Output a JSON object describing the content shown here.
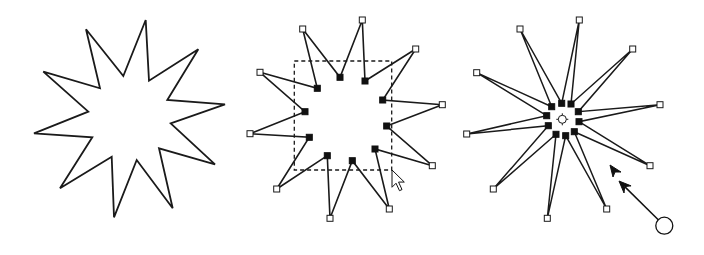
{
  "diagram": {
    "colors": {
      "stroke": "#1a1a1a",
      "handle_fill_outer": "#ffffff",
      "handle_fill_inner": "#111111",
      "background": "#ffffff"
    },
    "star_plain": {
      "outer": [
        [
          145.7,
          20
        ],
        [
          198.3,
          49.3
        ],
        [
          225,
          104.3
        ],
        [
          215,
          164.3
        ],
        [
          172.7,
          208.3
        ],
        [
          114,
          217.3
        ],
        [
          60,
          188.3
        ],
        [
          34,
          133.3
        ],
        [
          43.3,
          71.7
        ],
        [
          86,
          29.3
        ]
      ],
      "inner": [
        [
          149,
          80.7
        ],
        [
          167.3,
          100
        ],
        [
          170.7,
          123.3
        ],
        [
          159,
          148.3
        ],
        [
          136.7,
          160
        ],
        [
          111.7,
          156.7
        ],
        [
          92.3,
          137.3
        ],
        [
          88.3,
          111.7
        ],
        [
          100,
          88.3
        ],
        [
          123.3,
          76
        ]
      ]
    },
    "star_selected": {
      "outer": [
        [
          362.3,
          20
        ],
        [
          415.7,
          49
        ],
        [
          442.3,
          104.7
        ],
        [
          432.3,
          165.7
        ],
        [
          389.3,
          209
        ],
        [
          330,
          218.3
        ],
        [
          276.7,
          189
        ],
        [
          250,
          133.7
        ],
        [
          260,
          72.3
        ],
        [
          302.7,
          29
        ]
      ],
      "inner": [
        [
          365,
          81
        ],
        [
          382.7,
          100
        ],
        [
          386.7,
          126
        ],
        [
          375,
          149
        ],
        [
          352.3,
          160.7
        ],
        [
          327.3,
          155.7
        ],
        [
          309.3,
          137.3
        ],
        [
          305,
          111.7
        ],
        [
          317.3,
          88.3
        ],
        [
          340,
          77.3
        ]
      ],
      "bounding_box": {
        "x": 294.3,
        "y": 61,
        "width": 97.4,
        "height": 109
      },
      "cursor": {
        "tip": [
          392,
          170
        ]
      }
    },
    "star_scaled": {
      "outer": [
        [
          579.3,
          20
        ],
        [
          632.7,
          49
        ],
        [
          660,
          104.7
        ],
        [
          650,
          165.7
        ],
        [
          606.7,
          209
        ],
        [
          547.3,
          218.3
        ],
        [
          493.3,
          189
        ],
        [
          466.7,
          134
        ],
        [
          476.7,
          72.7
        ],
        [
          520,
          29
        ]
      ],
      "inner": [
        [
          571,
          104
        ],
        [
          578.3,
          111.7
        ],
        [
          579,
          121.7
        ],
        [
          574.3,
          131.7
        ],
        [
          565.7,
          135.7
        ],
        [
          556,
          134.3
        ],
        [
          548.3,
          125.7
        ],
        [
          546.7,
          115.7
        ],
        [
          551.7,
          106.7
        ],
        [
          561.7,
          103.3
        ]
      ],
      "center": [
        562.3,
        119.3
      ],
      "drag_arrow": {
        "tip": [
          619,
          181
        ],
        "tail_circle": [
          664.3,
          225.7
        ],
        "circle_radius": 8.5
      },
      "cursor": {
        "tip": [
          610,
          165
        ]
      }
    }
  }
}
